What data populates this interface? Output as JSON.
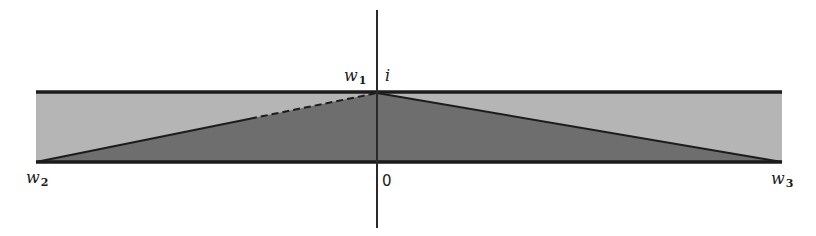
{
  "diagram": {
    "colors": {
      "band_fill": "#b5b5b5",
      "triangle_fill": "#6e6e6e",
      "border": "#1c1c1c",
      "axis": "#2a2a2a",
      "background": "#ffffff"
    },
    "labels": {
      "w1": {
        "base": "w",
        "sub": "1"
      },
      "i": "i",
      "w2": {
        "base": "w",
        "sub": "2"
      },
      "w3": {
        "base": "w",
        "sub": "3"
      },
      "origin": "0"
    },
    "geometry": {
      "band": {
        "x1": 36,
        "x2": 782,
        "y_top": 92,
        "y_bottom": 162
      },
      "axis": {
        "x": 377,
        "y1": 10,
        "y2": 228
      },
      "triangle": {
        "apex": [
          377,
          92
        ],
        "left": [
          36,
          162
        ],
        "right": [
          782,
          162
        ]
      },
      "left_edge_dashed_from_x": 250
    }
  }
}
